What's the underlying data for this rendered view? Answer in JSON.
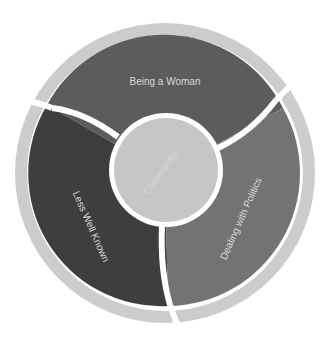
{
  "diagram": {
    "type": "concentric-ring",
    "center": {
      "label": "Community",
      "color": "#c6c6c6"
    },
    "segments": [
      {
        "label": "Being a Woman",
        "color": "#5c5c5c"
      },
      {
        "label": "Less Well Known",
        "color": "#3e3e3e"
      },
      {
        "label": "Dealing with Politics",
        "color": "#737373"
      }
    ],
    "outer_ring": {
      "color": "#cccccc",
      "segments": 3
    },
    "divider_color": "#ffffff"
  }
}
